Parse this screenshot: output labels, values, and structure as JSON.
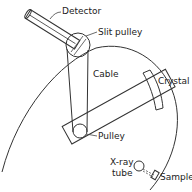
{
  "diagram": {
    "type": "x-ray spectrometer schematic",
    "labels": {
      "detector": "Detector",
      "slit_pulley": "Slit pulley",
      "cable": "Cable",
      "crystal": "Crystal",
      "pulley": "Pulley",
      "xray_tube_line1": "X-ray",
      "xray_tube_line2": "tube",
      "sample": "Sample"
    },
    "colors": {
      "stroke": "#333333",
      "text": "#222222",
      "background": "#ffffff"
    }
  }
}
